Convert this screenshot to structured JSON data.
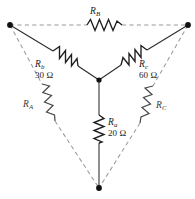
{
  "figure": {
    "type": "circuit-diagram",
    "width": 195,
    "height": 199,
    "background": "#ffffff"
  },
  "colors": {
    "solid_wire": "#2b2b2b",
    "dashed_wire": "#9a9a9a",
    "resistor_dark": "#1f1f1f",
    "resistor_gray": "#4a4a4a",
    "node": "#111111",
    "text": "#1a1a1a"
  },
  "units": {
    "ohm": "Ω"
  },
  "nodes": [
    {
      "id": "top-left",
      "x": 10,
      "y": 25
    },
    {
      "id": "top-right",
      "x": 188,
      "y": 25
    },
    {
      "id": "center",
      "x": 99,
      "y": 80
    },
    {
      "id": "bottom",
      "x": 99,
      "y": 188
    }
  ],
  "wye": {
    "style": "solid",
    "branches": [
      {
        "id": "branch-rb",
        "symbol": "R",
        "subscript": "b",
        "value": "30",
        "unit": "Ω",
        "value_label": "30 Ω",
        "from": "top-left",
        "to": "center"
      },
      {
        "id": "branch-rc",
        "symbol": "R",
        "subscript": "c",
        "value": "60",
        "unit": "Ω",
        "value_label": "60 Ω",
        "from": "top-right",
        "to": "center"
      },
      {
        "id": "branch-ra",
        "symbol": "R",
        "subscript": "a",
        "value": "20",
        "unit": "Ω",
        "value_label": "20 Ω",
        "from": "center",
        "to": "bottom"
      }
    ]
  },
  "delta": {
    "style": "dashed",
    "branches": [
      {
        "id": "branch-RB",
        "symbol": "R",
        "subscript": "B",
        "value": "",
        "unit": "",
        "value_label": "",
        "from": "top-left",
        "to": "top-right"
      },
      {
        "id": "branch-RA",
        "symbol": "R",
        "subscript": "A",
        "value": "",
        "unit": "",
        "value_label": "",
        "from": "top-left",
        "to": "bottom"
      },
      {
        "id": "branch-RC",
        "symbol": "R",
        "subscript": "C",
        "value": "",
        "unit": "",
        "value_label": "",
        "from": "top-right",
        "to": "bottom"
      }
    ]
  },
  "labels": {
    "rb_sym": "R",
    "rb_sub": "b",
    "rb_val": "30 Ω",
    "rc_sym": "R",
    "rc_sub": "c",
    "rc_val": "60 Ω",
    "ra_sym": "R",
    "ra_sub": "a",
    "ra_val": "20 Ω",
    "RB_sym": "R",
    "RB_sub": "B",
    "RA_sym": "R",
    "RA_sub": "A",
    "RC_sym": "R",
    "RC_sub": "C"
  }
}
